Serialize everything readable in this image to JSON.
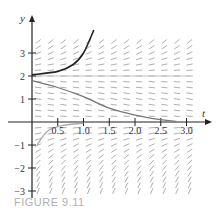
{
  "chart_data": {
    "type": "line",
    "title": "",
    "caption": "FIGURE 9.11",
    "xlabel": "t",
    "ylabel": "y",
    "xlim": [
      0,
      3.1
    ],
    "ylim": [
      -3.2,
      3.8
    ],
    "x_ticks": [
      "0.5",
      "1.0",
      "1.5",
      "2.0",
      "2.5",
      "3.0"
    ],
    "y_ticks": [
      "3",
      "2",
      "1",
      "-1",
      "-2",
      "-3"
    ],
    "grid": false,
    "slope_field": {
      "equation": "dy/dt proportional to y(y-2)",
      "t_range": [
        0,
        3
      ],
      "y_range": [
        -3,
        3.6
      ]
    },
    "equilibrium_line": {
      "y": 2,
      "color": "#c0c0c0"
    },
    "series": [
      {
        "name": "solution above y=2",
        "color": "#222222",
        "points": [
          [
            0,
            2.05
          ],
          [
            0.5,
            2.2
          ],
          [
            0.8,
            2.5
          ],
          [
            1.0,
            3.0
          ],
          [
            1.2,
            4.0
          ]
        ]
      },
      {
        "name": "solution between 0 and 2",
        "color": "#777777",
        "points": [
          [
            0,
            1.8
          ],
          [
            0.5,
            1.5
          ],
          [
            1.0,
            1.1
          ],
          [
            1.5,
            0.6
          ],
          [
            2.0,
            0.3
          ],
          [
            2.5,
            0.1
          ],
          [
            2.8,
            0.03
          ]
        ]
      },
      {
        "name": "solution below 0",
        "color": "#aaaaaa",
        "points": [
          [
            0.1,
            -1.0
          ],
          [
            0.3,
            -0.4
          ],
          [
            0.6,
            -0.15
          ],
          [
            1.0,
            -0.05
          ]
        ]
      }
    ]
  },
  "labels": {
    "t_axis": "t",
    "y_axis": "y",
    "caption": "FIGURE 9.11"
  }
}
